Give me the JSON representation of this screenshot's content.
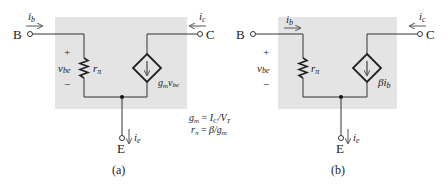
{
  "colors": {
    "background": "#ffffff",
    "box_fill": "#e4e4e4",
    "wire": "#333333",
    "text": "#222222",
    "arrow": "#555555"
  },
  "panels": [
    {
      "id": "a",
      "caption": "(a)",
      "terminals": {
        "base": "B",
        "collector": "C",
        "emitter": "E"
      },
      "currents": {
        "base": "i",
        "base_sub": "b",
        "collector": "i",
        "collector_sub": "c",
        "emitter": "i",
        "emitter_sub": "e"
      },
      "vbe": {
        "plus": "+",
        "minus": "−",
        "v": "v",
        "sub": "be"
      },
      "resistor": {
        "r": "r",
        "sub": "π"
      },
      "source": {
        "g": "g",
        "g_sub": "m",
        "v": "v",
        "v_sub": "be"
      }
    },
    {
      "id": "b",
      "caption": "(b)",
      "terminals": {
        "base": "B",
        "collector": "C",
        "emitter": "E"
      },
      "currents": {
        "base": "i",
        "base_sub": "b",
        "collector": "i",
        "collector_sub": "c",
        "emitter": "i",
        "emitter_sub": "e"
      },
      "vbe": {
        "plus": "+",
        "minus": "−",
        "v": "v",
        "sub": "be"
      },
      "resistor": {
        "r": "r",
        "sub": "π"
      },
      "source": {
        "beta": "β",
        "i": "i",
        "i_sub": "b"
      }
    }
  ],
  "formulas": [
    {
      "lhs": "g",
      "lhs_sub": "m",
      "eq": " = ",
      "rhs1": "I",
      "rhs1_sub": "C",
      "slash": "/",
      "rhs2": "V",
      "rhs2_sub": "T"
    },
    {
      "lhs": "r",
      "lhs_sub": "π",
      "eq": " = ",
      "rhs1": "β",
      "slash": "/",
      "rhs2": "g",
      "rhs2_sub": "m"
    }
  ]
}
